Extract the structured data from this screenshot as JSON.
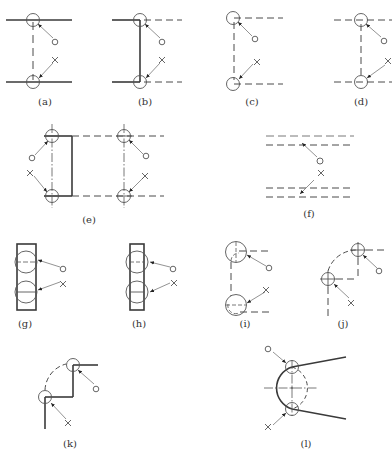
{
  "figure": {
    "legend": {
      "correct_symbol": "○",
      "incorrect_symbol": "×"
    },
    "panels": [
      {
        "id": "a",
        "caption": "(a)",
        "x": 45,
        "y": 104
      },
      {
        "id": "b",
        "caption": "(b)",
        "x": 145,
        "y": 104
      },
      {
        "id": "c",
        "caption": "(c)",
        "x": 252,
        "y": 104
      },
      {
        "id": "d",
        "caption": "(d)",
        "x": 361,
        "y": 104
      },
      {
        "id": "e",
        "caption": "(e)",
        "x": 89,
        "y": 222
      },
      {
        "id": "f",
        "caption": "(f)",
        "x": 309,
        "y": 216
      },
      {
        "id": "g",
        "caption": "(g)",
        "x": 25,
        "y": 326
      },
      {
        "id": "h",
        "caption": "(h)",
        "x": 139,
        "y": 326
      },
      {
        "id": "i",
        "caption": "(i)",
        "x": 245,
        "y": 326
      },
      {
        "id": "j",
        "caption": "(j)",
        "x": 343,
        "y": 326
      },
      {
        "id": "k",
        "caption": "(k)",
        "x": 70,
        "y": 446
      },
      {
        "id": "l",
        "caption": "(l)",
        "x": 306,
        "y": 446
      }
    ]
  }
}
